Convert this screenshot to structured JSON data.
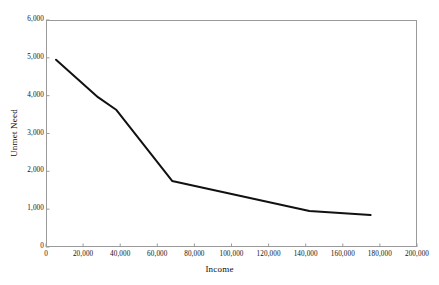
{
  "chart_data": {
    "type": "line",
    "title": "",
    "xlabel": "Income",
    "ylabel": "Unmet Need",
    "xlim": [
      0,
      200000
    ],
    "ylim": [
      0,
      6000
    ],
    "grid": false,
    "legend": null,
    "xticks": [
      "0",
      "20,000",
      "40,000",
      "60,000",
      "80,000",
      "100,000",
      "120,000",
      "140,000",
      "160,000",
      "180,000",
      "200,000"
    ],
    "xtick_values": [
      0,
      20000,
      40000,
      60000,
      80000,
      100000,
      120000,
      140000,
      160000,
      180000,
      200000
    ],
    "yticks": [
      "0",
      "1,000",
      "2,000",
      "3,000",
      "4,000",
      "5,000",
      "6,000"
    ],
    "ytick_values": [
      0,
      1000,
      2000,
      3000,
      4000,
      5000,
      6000
    ],
    "series": [
      {
        "name": "Unmet Need",
        "color": "#111111",
        "x": [
          5400,
          28000,
          38000,
          68000,
          142000,
          175000
        ],
        "y": [
          4950,
          3960,
          3620,
          1745,
          950,
          845
        ]
      }
    ],
    "line_color": "#111111",
    "frame_color": "#9a9a9a",
    "background": "#ffffff"
  }
}
